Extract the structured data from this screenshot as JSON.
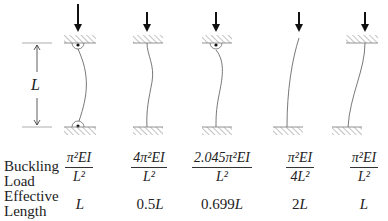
{
  "diagram": {
    "length_label": "L",
    "row_labels": {
      "buckling": [
        "Buckling",
        "Load"
      ],
      "effective": [
        "Effective",
        "Length"
      ]
    },
    "columns": [
      {
        "id": "pinned-pinned",
        "top": "pinned",
        "bottom": "pinned",
        "load": {
          "coef": "",
          "num": "π²EI",
          "den": "L²"
        },
        "effective_length": {
          "coef": "",
          "var": "L"
        }
      },
      {
        "id": "fixed-fixed",
        "top": "fixed",
        "bottom": "fixed",
        "load": {
          "num": "4π²EI",
          "den": "L²"
        },
        "effective_length": {
          "coef": "0.5",
          "var": "L"
        }
      },
      {
        "id": "pinned-fixed",
        "top": "pinned",
        "bottom": "fixed",
        "load": {
          "num": "2.045π²EI",
          "den": "L²"
        },
        "effective_length": {
          "coef": "0.699",
          "var": "L"
        }
      },
      {
        "id": "free-fixed",
        "top": "free",
        "bottom": "fixed",
        "load": {
          "num": "π²EI",
          "den": "4L²"
        },
        "effective_length": {
          "coef": "2",
          "var": "L"
        }
      },
      {
        "id": "fixed-sway-fixed",
        "top": "fixed (sway)",
        "bottom": "fixed",
        "load": {
          "num": "π²EI",
          "den": "L²"
        },
        "effective_length": {
          "coef": "",
          "var": "L"
        }
      }
    ]
  }
}
